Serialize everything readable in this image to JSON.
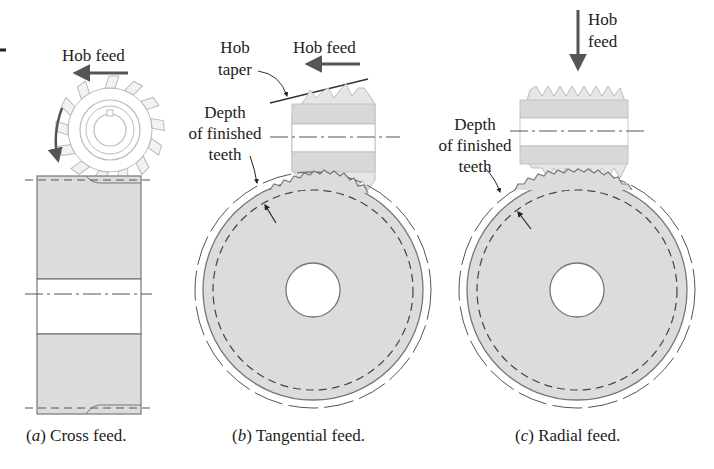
{
  "figure": {
    "panels": [
      {
        "id": "a",
        "caption_letter": "a",
        "caption_text": "Cross feed.",
        "labels": {
          "hob_feed": "Hob feed"
        }
      },
      {
        "id": "b",
        "caption_letter": "b",
        "caption_text": "Tangential feed.",
        "labels": {
          "hob_taper_1": "Hob",
          "hob_taper_2": "taper",
          "hob_feed": "Hob feed",
          "depth_1": "Depth",
          "depth_2": "of finished",
          "depth_3": "teeth"
        }
      },
      {
        "id": "c",
        "caption_letter": "c",
        "caption_text": "Radial feed.",
        "labels": {
          "hob_feed_1": "Hob",
          "hob_feed_2": "feed",
          "depth_1": "Depth",
          "depth_2": "of finished",
          "depth_3": "teeth"
        }
      }
    ],
    "colors": {
      "fill": "#dcdcdc",
      "stroke": "#6a6a6a",
      "arrow": "#5a5a5a",
      "hob_fill": "#e4e4e4"
    }
  }
}
